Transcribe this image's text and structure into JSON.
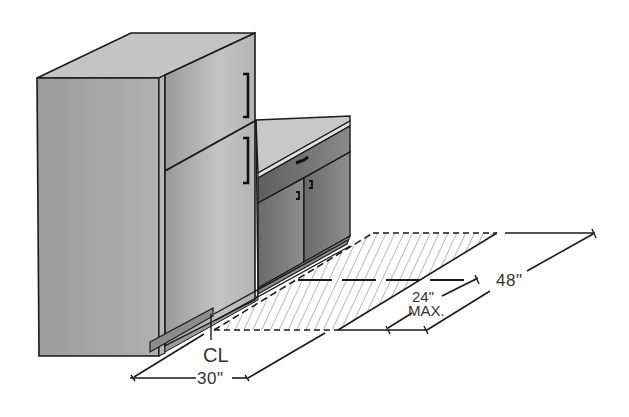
{
  "diagram": {
    "components": {
      "refrigerator": "top-freezer refrigerator",
      "cabinet": "base cabinet with drawer and double doors",
      "clear_floor_space": "hatched clear floor area"
    },
    "dimensions": {
      "width": "30\"",
      "depth_max_line1": "24\"",
      "depth_max_line2": "MAX.",
      "length": "48\""
    },
    "centerline_symbol": "CL"
  },
  "colors": {
    "line": "#1a1a1a",
    "fridge_front": "#a8a8a8",
    "fridge_top": "#c4c4c4",
    "fridge_door": "#b4b4b4",
    "cabinet_top": "#c8c8c8",
    "cabinet_body": "#7a7a7a",
    "hatch": "#8a8a8a",
    "toe_kick": "#8c8c8c"
  }
}
